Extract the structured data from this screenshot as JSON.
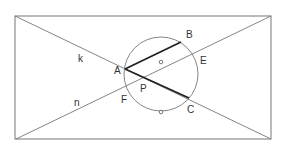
{
  "diagram": {
    "type": "geometry-construction",
    "colors": {
      "thin_line": "#777777",
      "thick_line": "#222222",
      "label": "#333333",
      "background": "#ffffff"
    },
    "rectangle": {
      "x1": 15,
      "y1": 16,
      "x2": 271,
      "y2": 139
    },
    "lines": [
      {
        "name": "k",
        "x1": 15,
        "y1": 16,
        "x2": 271,
        "y2": 139
      },
      {
        "name": "n",
        "x1": 16,
        "y1": 139,
        "x2": 271,
        "y2": 16
      }
    ],
    "circle": {
      "cx": 161,
      "cy": 74,
      "r": 37
    },
    "chords": [
      {
        "name": "AB",
        "from": "A",
        "to": "B"
      },
      {
        "name": "AC",
        "from": "A",
        "to": "C"
      }
    ],
    "markers": [
      {
        "name": "inner-marker",
        "x": 161,
        "y": 62
      },
      {
        "name": "bottom-marker",
        "x": 161,
        "y": 112
      }
    ],
    "points": {
      "A": {
        "x": 125,
        "y": 69
      },
      "B": {
        "x": 181,
        "y": 42
      },
      "C": {
        "x": 189,
        "y": 98
      },
      "E": {
        "x": 194,
        "y": 55
      },
      "F": {
        "x": 127,
        "y": 86
      },
      "P": {
        "x": 143,
        "y": 78
      }
    },
    "labels": {
      "A": {
        "text": "A",
        "x": 114,
        "y": 74
      },
      "B": {
        "text": "B",
        "x": 186,
        "y": 38
      },
      "C": {
        "text": "C",
        "x": 187,
        "y": 113
      },
      "E": {
        "text": "E",
        "x": 200,
        "y": 64
      },
      "F": {
        "text": "F",
        "x": 121,
        "y": 103
      },
      "P": {
        "text": "P",
        "x": 140,
        "y": 92
      },
      "k": {
        "text": "k",
        "x": 78,
        "y": 62
      },
      "n": {
        "text": "n",
        "x": 74,
        "y": 106
      }
    }
  }
}
